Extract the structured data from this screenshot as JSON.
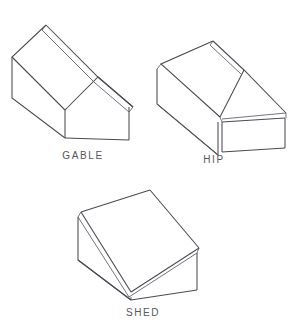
{
  "figure": {
    "background_color": "#ffffff",
    "line_color": "#4a4a52",
    "text_color": "#55555c",
    "width": 294,
    "height": 325
  },
  "diagrams": [
    {
      "id": "gable",
      "label": "GABLE",
      "label_x": 83,
      "label_y": 159,
      "description": "Gable roof drawn in isometric view with two sloping planes meeting at a ridge",
      "shapes": {
        "roof_plane_far": "46,25 98,77 65,110 12,57",
        "roof_plane_near": "98,77 133,107 129,112 95,83",
        "ridge_board_far": "46,25 98,77 95,83 42,30",
        "wall_left": "12,57 12,98 65,138 65,110",
        "wall_front": "65,110 65,138 129,140 129,107",
        "gable_end_triangle": "65,110 98,77 129,107"
      },
      "outlines": [
        "46,25 98,77 133,107",
        "46,25 12,57 65,110",
        "12,57 12,98 65,138",
        "65,138 129,140",
        "129,140 129,107",
        "65,110 65,138",
        "65,110 98,77 133,107",
        "42,30 95,83",
        "95,83 129,112",
        "42,30 46,25",
        "129,112 133,107",
        "65,110 12,57"
      ]
    },
    {
      "id": "hip",
      "label": "HIP",
      "label_x": 214,
      "label_y": 163,
      "description": "Hip roof drawn in isometric view with a short ridge and four sloping planes",
      "shapes": {
        "roof_plane_main": "213,41 244,70 220,117 161,64",
        "roof_plane_hip_end": "244,70 286,113 222,119",
        "ridge_board": "213,41 244,70 241,74 210,45",
        "wall_left": "157,69 157,104 218,155 218,122",
        "wall_front": "222,122 285,118 285,148 222,152",
        "eave_band_left": "161,64 220,117 218,122 157,69",
        "eave_band_front": "220,119 286,113 286,118 221,124"
      },
      "outlines": [
        "213,41 244,70 286,113",
        "213,41 161,64 220,117",
        "161,64 157,69",
        "157,69 157,104 218,155",
        "218,155 218,122",
        "220,117 222,122",
        "222,122 285,118",
        "285,118 285,148",
        "222,152 285,148",
        "222,122 222,152",
        "244,70 220,117",
        "286,113 222,119",
        "210,45 241,74",
        "210,45 213,41",
        "157,104 218,155",
        "286,113 286,118"
      ]
    },
    {
      "id": "shed",
      "label": "SHED",
      "label_x": 143,
      "label_y": 316,
      "description": "Shed roof drawn in isometric view with a single sloping plane",
      "shapes": {
        "roof_plane": "150,190 199,248 131,292 81,212",
        "roof_edge_left": "81,212 131,292 129,297 78,217",
        "roof_edge_right": "199,248 131,292 129,297 197,253",
        "wall_left": "78,217 78,260 129,297 129,292",
        "wall_front": "131,297 197,253 197,290 131,300",
        "wall_right": "197,253 197,290"
      },
      "outlines": [
        "150,190 199,248",
        "150,190 81,212",
        "81,212 131,292",
        "199,248 131,292",
        "78,217 129,297",
        "78,217 81,212",
        "197,253 199,248",
        "129,297 197,253",
        "78,217 78,260 131,300",
        "131,300 197,290",
        "197,290 197,253",
        "131,297 131,300",
        "78,260 131,300"
      ]
    }
  ]
}
